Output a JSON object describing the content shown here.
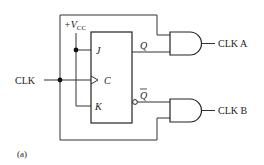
{
  "diagram": {
    "caption": "(a)",
    "input": {
      "label": "CLK"
    },
    "supply": {
      "label_prefix": "+V",
      "label_sub": "CC"
    },
    "flip_flop": {
      "type": "JK",
      "pins": {
        "j": "J",
        "c": "C",
        "k": "K",
        "q": "Q",
        "qbar": "Q"
      }
    },
    "gates": [
      {
        "type": "AND",
        "output_label": "CLK A"
      },
      {
        "type": "AND",
        "output_label": "CLK B"
      }
    ],
    "colors": {
      "line": "#222222",
      "background": "#ffffff"
    }
  }
}
